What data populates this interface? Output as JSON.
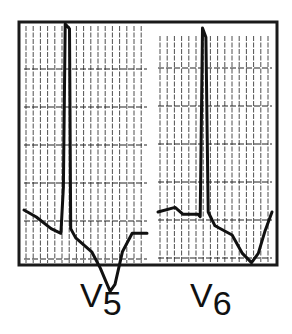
{
  "figure": {
    "title": "",
    "frame_color": "#1a1a1a",
    "trace_color": "#111111",
    "grid_color": "#222222"
  },
  "leads": [
    {
      "id": "v5",
      "letter": "V",
      "number": "5",
      "description": "Tall R wave with downsloping ST depression and inverted T wave",
      "waveform": [
        [
          0.0,
          0.2
        ],
        [
          0.1,
          0.17
        ],
        [
          0.22,
          0.12
        ],
        [
          0.3,
          0.1
        ],
        [
          0.32,
          0.3
        ],
        [
          0.335,
          1.0
        ],
        [
          0.37,
          0.98
        ],
        [
          0.38,
          0.12
        ],
        [
          0.42,
          0.08
        ],
        [
          0.55,
          0.02
        ],
        [
          0.62,
          -0.05
        ],
        [
          0.7,
          -0.15
        ],
        [
          0.74,
          -0.12
        ],
        [
          0.8,
          0.02
        ],
        [
          0.88,
          0.1
        ],
        [
          1.0,
          0.1
        ]
      ]
    },
    {
      "id": "v6",
      "letter": "V",
      "number": "6",
      "description": "Tall R wave with downsloping ST depression and inverted T wave",
      "waveform": [
        [
          0.0,
          0.2
        ],
        [
          0.15,
          0.22
        ],
        [
          0.22,
          0.19
        ],
        [
          0.35,
          0.19
        ],
        [
          0.37,
          0.18
        ],
        [
          0.39,
          1.0
        ],
        [
          0.42,
          0.96
        ],
        [
          0.44,
          0.2
        ],
        [
          0.5,
          0.14
        ],
        [
          0.65,
          0.1
        ],
        [
          0.74,
          0.02
        ],
        [
          0.82,
          -0.02
        ],
        [
          0.88,
          0.02
        ],
        [
          0.94,
          0.12
        ],
        [
          1.0,
          0.2
        ]
      ]
    }
  ]
}
